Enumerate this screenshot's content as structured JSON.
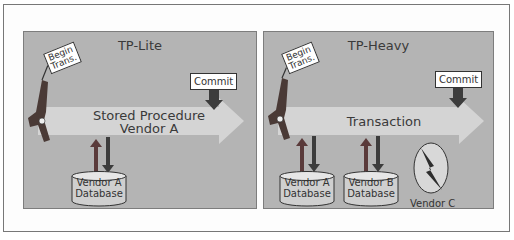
{
  "figure": {
    "panels": [
      {
        "id": "tp-lite",
        "title": "TP-Lite",
        "flag_label_line1": "Begin",
        "flag_label_line2": "Trans.",
        "commit_label": "Commit",
        "arrow_label_line1": "Stored Procedure",
        "arrow_label_line2": "Vendor A",
        "databases": [
          {
            "line1": "Vendor A",
            "line2": "Database"
          }
        ]
      },
      {
        "id": "tp-heavy",
        "title": "TP-Heavy",
        "flag_label_line1": "Begin",
        "flag_label_line2": "Trans.",
        "commit_label": "Commit",
        "arrow_label": "Transaction",
        "databases": [
          {
            "line1": "Vendor A",
            "line2": "Database"
          },
          {
            "line1": "Vendor B",
            "line2": "Database"
          }
        ],
        "external_resource_label": "Vendor C",
        "external_resource_icon": "lightning-bolt-icon"
      }
    ]
  },
  "colors": {
    "panel_bg": "#b4b4b4",
    "arrow_fill": "#d6d6d6",
    "dark_arrow": "#3c3c3c",
    "db_fill": "#cfcfcf",
    "gun": "#4a3a36"
  }
}
